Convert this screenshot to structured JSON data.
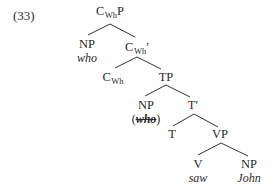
{
  "example": {
    "number": "(33)"
  },
  "tree": {
    "root": {
      "cat_base": "C",
      "cat_sub": "Wh",
      "cat_suffix": "P"
    },
    "spec_np": {
      "cat": "NP",
      "word": "who"
    },
    "cbar": {
      "cat_base": "C",
      "cat_sub": "Wh",
      "cat_suffix": "′"
    },
    "head_c": {
      "cat_base": "C",
      "cat_sub": "Wh"
    },
    "tp": {
      "cat": "TP"
    },
    "tp_spec_np": {
      "cat": "NP",
      "open_paren": "(",
      "word": "who",
      "close_paren": ")"
    },
    "tbar": {
      "cat": "T′"
    },
    "t": {
      "cat": "T"
    },
    "vp": {
      "cat": "VP"
    },
    "v": {
      "cat": "V",
      "word": "saw"
    },
    "obj_np": {
      "cat": "NP",
      "word": "John"
    }
  }
}
